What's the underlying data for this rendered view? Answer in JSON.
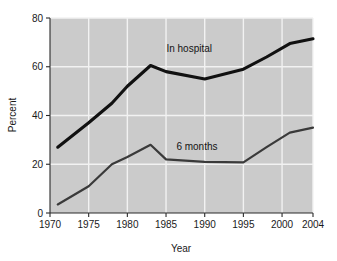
{
  "chart_data": {
    "type": "line",
    "title": "",
    "xlabel": "Year",
    "ylabel": "Percent",
    "xlim": [
      1970,
      2004
    ],
    "ylim": [
      0,
      80
    ],
    "grid": true,
    "legend_position": "inline-annotation",
    "x_ticks": [
      "1970",
      "1975",
      "1980",
      "1985",
      "1990",
      "1995",
      "2000",
      "2004"
    ],
    "x_tick_values": [
      1970,
      1975,
      1980,
      1985,
      1990,
      1995,
      2000,
      2004
    ],
    "y_ticks": [
      "0",
      "20",
      "40",
      "60",
      "80"
    ],
    "y_tick_values": [
      0,
      20,
      40,
      60,
      80
    ],
    "series": [
      {
        "name": "In hospital",
        "color": "#111111",
        "x": [
          1971,
          1975,
          1978,
          1980,
          1983,
          1985,
          1990,
          1995,
          1998,
          2001,
          2004
        ],
        "values": [
          27,
          37,
          45,
          52,
          60.5,
          58,
          55,
          59,
          64,
          69.5,
          71.5
        ]
      },
      {
        "name": "6 months",
        "color": "#3a3a3a",
        "x": [
          1971,
          1975,
          1978,
          1980,
          1983,
          1985,
          1990,
          1995,
          1998,
          2001,
          2004
        ],
        "values": [
          3.5,
          11,
          20,
          23,
          28,
          22,
          21,
          20.8,
          27,
          33,
          35
        ]
      }
    ],
    "annotations": [
      {
        "text": "In hospital",
        "x": 1988,
        "y": 66
      },
      {
        "text": "6 months",
        "x": 1989,
        "y": 26
      }
    ]
  },
  "colors": {
    "plot_background": "#cbcbcb",
    "gridline": "#f2f2f2",
    "axis": "#2a2a2a",
    "page_background": "#ffffff",
    "series_hospital": "#111111",
    "series_months": "#3a3a3a"
  }
}
